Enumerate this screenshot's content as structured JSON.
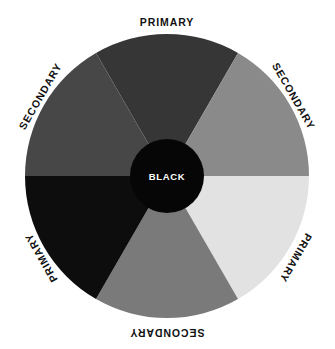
{
  "figure": {
    "background_color": "#ffffff",
    "center_x": 167,
    "center_y": 176,
    "radius": 142,
    "hub_radius": 37
  },
  "hub": {
    "label": "BLACK",
    "fill_color": "#060606",
    "text_color": "#ffffff"
  },
  "chart_data": {
    "type": "pie",
    "xlabel": "",
    "ylabel": "",
    "legend_position": "around-arc",
    "grid": false,
    "categories": [
      "PRIMARY",
      "SECONDARY",
      "PRIMARY",
      "SECONDARY",
      "PRIMARY",
      "SECONDARY"
    ],
    "values": [
      60,
      60,
      60,
      60,
      60,
      60
    ],
    "colors": [
      "#363636",
      "#8a8a8a",
      "#e2e2e2",
      "#7a7a7a",
      "#0d0d0d",
      "#474747"
    ],
    "annotations": [
      "BLACK"
    ]
  },
  "segments": [
    {
      "id": "segment-top",
      "label": "PRIMARY",
      "kind": "primary",
      "fill_color": "#363636",
      "start_angle": 240,
      "end_angle": 300,
      "label_x": 167,
      "label_y": 22,
      "label_rotation": 0
    },
    {
      "id": "segment-upper-right",
      "label": "SECONDARY",
      "kind": "secondary",
      "fill_color": "#8a8a8a",
      "start_angle": 300,
      "end_angle": 360,
      "label_x": 294,
      "label_y": 96,
      "label_rotation": 60
    },
    {
      "id": "segment-lower-right",
      "label": "PRIMARY",
      "kind": "primary",
      "fill_color": "#e2e2e2",
      "start_angle": 0,
      "end_angle": 60,
      "label_x": 296,
      "label_y": 258,
      "label_rotation": 120
    },
    {
      "id": "segment-bottom",
      "label": "SECONDARY",
      "kind": "secondary",
      "fill_color": "#7a7a7a",
      "start_angle": 60,
      "end_angle": 120,
      "label_x": 167,
      "label_y": 333,
      "label_rotation": 180
    },
    {
      "id": "segment-lower-left",
      "label": "PRIMARY",
      "kind": "primary",
      "fill_color": "#0d0d0d",
      "start_angle": 120,
      "end_angle": 180,
      "label_x": 41,
      "label_y": 258,
      "label_rotation": 240
    },
    {
      "id": "segment-upper-left",
      "label": "SECONDARY",
      "kind": "secondary",
      "fill_color": "#474747",
      "start_angle": 180,
      "end_angle": 240,
      "label_x": 40,
      "label_y": 96,
      "label_rotation": 300
    }
  ]
}
